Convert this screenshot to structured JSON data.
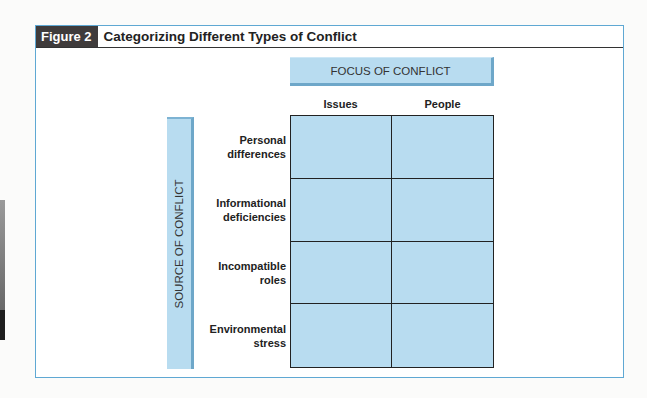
{
  "figure": {
    "badge": "Figure 2",
    "title": "Categorizing Different Types of Conflict"
  },
  "focus": {
    "label": "FOCUS OF CONFLICT",
    "columns": [
      "Issues",
      "People"
    ]
  },
  "source": {
    "label": "SOURCE OF CONFLICT",
    "rows": [
      {
        "line1": "Personal",
        "line2": "differences"
      },
      {
        "line1": "Informational",
        "line2": "deficiencies"
      },
      {
        "line1": "Incompatible",
        "line2": "roles"
      },
      {
        "line1": "Environmental",
        "line2": "stress"
      }
    ]
  },
  "colors": {
    "cell_fill": "#b8dcf0",
    "frame_border": "#5fa8d3",
    "badge_bg": "#3f3b3b"
  }
}
